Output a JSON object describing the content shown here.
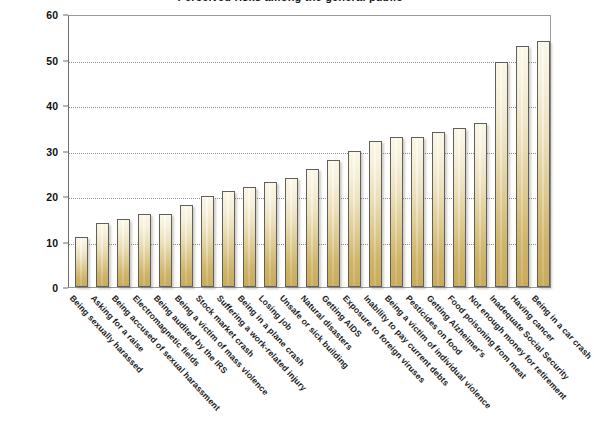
{
  "figure": {
    "title_clipped": "Perceived risks among the general public",
    "ylabel": "",
    "xlabel": ""
  },
  "axis": {
    "y_ticks": [
      0,
      10,
      20,
      30,
      40,
      50,
      60
    ],
    "y_min": 0,
    "y_max": 60
  },
  "colors": {
    "bar_top": "#fbf7e6",
    "bar_bottom": "#c9ab5a",
    "bar_outline": "#5f5f5f",
    "gridline": "#8d8d8d",
    "axis": "#6e6e6e",
    "text": "#1b1b1b",
    "background": "#ffffff"
  },
  "chart_data": {
    "type": "bar",
    "title": "Perceived risks among the general public",
    "xlabel": "",
    "ylabel": "",
    "ylim": [
      0,
      60
    ],
    "grid": true,
    "legend": "none",
    "categories": [
      "Being sexually harassed",
      "Asking for a raise",
      "Being accused of sexual harassment",
      "Electromagnetic fields",
      "Being audited by the IRS",
      "Being a victim of mass violence",
      "Stock market crash",
      "Suffering a work-related injury",
      "Being in a plane crash",
      "Losing job",
      "Unsafe or sick building",
      "Natural disasters",
      "Getting AIDS",
      "Exposure to foreign viruses",
      "Inability to pay current debts",
      "Being a victim of individual violence",
      "Pesticides on food",
      "Getting Alzheimer's",
      "Food poisoning from meat",
      "Not enough money for retirement",
      "Inadequate Social Security",
      "Having cancer",
      "Being in a car crash"
    ],
    "values": [
      11,
      14,
      15,
      16,
      16,
      18,
      20,
      21,
      22,
      23,
      24,
      26,
      28,
      30,
      32,
      33,
      33,
      34,
      35,
      36,
      49.5,
      53,
      54
    ]
  }
}
